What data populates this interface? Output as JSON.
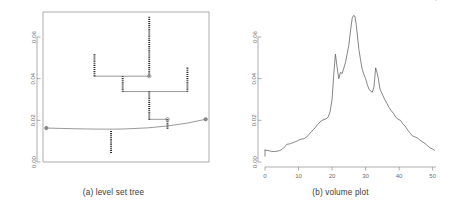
{
  "figure": {
    "panels": [
      {
        "id": "level-set-tree",
        "caption": "(a) level set tree",
        "y_ticks": [
          "0.00",
          "0.02",
          "0.04",
          "0.06"
        ]
      },
      {
        "id": "volume-plot",
        "caption": "(b) volume plot",
        "x_ticks": [
          "0",
          "10",
          "20",
          "30",
          "40",
          "50"
        ],
        "y_ticks": [
          "0.00",
          "0.02",
          "0.04",
          "0.06"
        ]
      }
    ],
    "colors": {
      "axis": "#8a8a8a",
      "tick_label": "#6e6e6e",
      "branch": "#2b2b2b",
      "connector": "#6d6d6d",
      "curve": "#5d5d5d",
      "caption": "#3a3a3a"
    }
  },
  "chart_data": [
    {
      "type": "tree",
      "title": "(a) level set tree",
      "xlabel": "",
      "ylabel": "",
      "ylim": [
        0.0,
        0.072
      ],
      "xlim": [
        0,
        100
      ],
      "grid": false,
      "legend": "none",
      "y_ticks": [
        0.0,
        0.02,
        0.04,
        0.06
      ],
      "root": {
        "level": 0.0165,
        "x_from": 2,
        "x_to": 98,
        "sag_to": 0.0155,
        "end_nodes": [
          {
            "x": 2,
            "y": 0.0163
          },
          {
            "x": 98,
            "y": 0.0205
          }
        ]
      },
      "branches": [
        {
          "name": "root-stem-down",
          "x": 41,
          "y_low": 0.0043,
          "y_high": 0.0152
        },
        {
          "name": "mid-right-split",
          "x": 75,
          "y_low": 0.016,
          "y_high": 0.0205
        },
        {
          "name": "trunk-up",
          "x": 64,
          "y_low": 0.0203,
          "y_high": 0.0338
        },
        {
          "name": "left-trunk",
          "x": 48,
          "y_low": 0.0337,
          "y_high": 0.0412
        },
        {
          "name": "right-tip",
          "x": 87,
          "y_low": 0.0337,
          "y_high": 0.0455
        },
        {
          "name": "left-tip",
          "x": 31,
          "y_low": 0.0411,
          "y_high": 0.0518
        },
        {
          "name": "tall-peak",
          "x": 64,
          "y_low": 0.041,
          "y_high": 0.07
        }
      ],
      "connectors": [
        {
          "name": "level-0.0205",
          "y": 0.0205,
          "x_from": 64,
          "x_to": 75
        },
        {
          "name": "level-0.0338",
          "y": 0.0338,
          "x_from": 48,
          "x_to": 87
        },
        {
          "name": "level-0.0412",
          "y": 0.0412,
          "x_from": 31,
          "x_to": 64
        }
      ],
      "open_nodes": [
        {
          "x": 64,
          "y": 0.0412
        },
        {
          "x": 75,
          "y": 0.0205
        }
      ]
    },
    {
      "type": "line",
      "title": "(b) volume plot",
      "xlabel": "",
      "ylabel": "",
      "xlim": [
        0,
        51
      ],
      "ylim": [
        0.0,
        0.072
      ],
      "x_ticks": [
        0,
        10,
        20,
        30,
        40,
        50
      ],
      "y_ticks": [
        0.0,
        0.02,
        0.04,
        0.06
      ],
      "grid": false,
      "legend": "none",
      "x": [
        0,
        0.6,
        1.2,
        2,
        2.8,
        3.6,
        4.4,
        5.2,
        6,
        6.5,
        7,
        7.6,
        8.2,
        9,
        9.7,
        10.4,
        11,
        11.7,
        12.4,
        13,
        13.7,
        14.4,
        15,
        15.7,
        16.4,
        17,
        17.6,
        18.2,
        18.8,
        19.4,
        20,
        20.5,
        21,
        21.5,
        22,
        22.5,
        23,
        23.5,
        24,
        24.5,
        25,
        25.5,
        26,
        26.4,
        26.8,
        27.2,
        27.6,
        28,
        28.5,
        29,
        29.5,
        30,
        30.5,
        31,
        31.5,
        32,
        32.5,
        33,
        33.4,
        33.8,
        34.3,
        35,
        35.7,
        36.4,
        37,
        37.7,
        38.4,
        39,
        39.7,
        40.4,
        41,
        41.8,
        42.5,
        43.2,
        44,
        44.8,
        45.5,
        46.2,
        47,
        47.8,
        48.5,
        49.2,
        50,
        50.6,
        51
      ],
      "y": [
        0.0057,
        0.0056,
        0.0054,
        0.0051,
        0.005,
        0.0052,
        0.0055,
        0.0062,
        0.0075,
        0.0085,
        0.0086,
        0.0088,
        0.0092,
        0.0097,
        0.0102,
        0.0108,
        0.011,
        0.0112,
        0.012,
        0.013,
        0.0143,
        0.0155,
        0.0165,
        0.018,
        0.0192,
        0.02,
        0.0204,
        0.0207,
        0.0215,
        0.024,
        0.03,
        0.042,
        0.0518,
        0.0455,
        0.04,
        0.043,
        0.0425,
        0.045,
        0.0478,
        0.052,
        0.056,
        0.063,
        0.069,
        0.0703,
        0.07,
        0.066,
        0.06,
        0.054,
        0.049,
        0.0445,
        0.042,
        0.04,
        0.0372,
        0.035,
        0.034,
        0.0335,
        0.036,
        0.0452,
        0.043,
        0.04,
        0.035,
        0.0325,
        0.03,
        0.028,
        0.0262,
        0.0245,
        0.0232,
        0.0215,
        0.0205,
        0.02,
        0.0185,
        0.0172,
        0.0155,
        0.014,
        0.0125,
        0.012,
        0.0115,
        0.0105,
        0.0096,
        0.0088,
        0.0078,
        0.0068,
        0.0062,
        0.0056
      ]
    }
  ]
}
